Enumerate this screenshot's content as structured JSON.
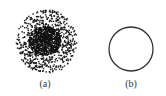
{
  "figure": {
    "panels": [
      {
        "id": "a",
        "label": "(a)",
        "kind": "dense-dot-scatter-disc",
        "dot_color": "#1a1a1a"
      },
      {
        "id": "b",
        "label": "(b)",
        "kind": "circle-outline",
        "stroke_color": "#333333"
      }
    ]
  }
}
